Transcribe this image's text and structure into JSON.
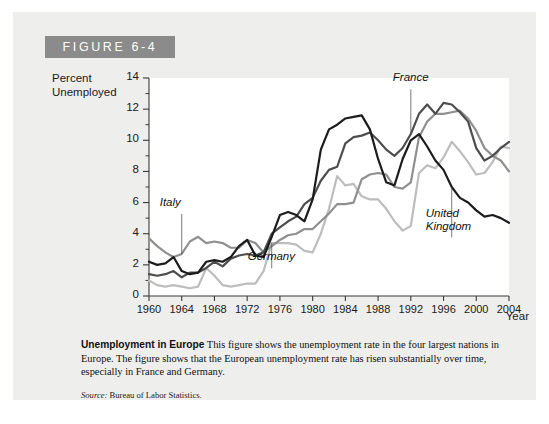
{
  "figure": {
    "tag": "FIGURE 6-4",
    "caption_title": "Unemployment in Europe",
    "caption_body": "This figure shows the unemployment rate in the four largest nations in Europe. The figure shows that the European unemployment rate has risen substantially over time, especially in France and Germany.",
    "source_label": "Source:",
    "source_text": "Bureau of Labor Statistics."
  },
  "colors": {
    "tag_background": "#8b8b8b",
    "panel_background": "#eeeeec",
    "plot_background": "#ffffff",
    "axis": "#3a3a3a",
    "united_kingdom": "#1c1c1c",
    "france": "#4d4d4d",
    "italy": "#8f8f8f",
    "germany": "#bdbdbd"
  },
  "chart_data": {
    "type": "line",
    "title": "Unemployment in Europe",
    "xlabel": "Year",
    "ylabel": "Percent Unemployed",
    "ylabel_lines": "Percent\nUnemployed",
    "xlim": [
      1960,
      2004
    ],
    "ylim": [
      0,
      14
    ],
    "grid": false,
    "legend": "inline-annotations",
    "ytick_labels": [
      "0",
      "2",
      "4",
      "6",
      "8",
      "10",
      "12",
      "14"
    ],
    "ytick_values": [
      0,
      2,
      4,
      6,
      8,
      10,
      12,
      14
    ],
    "yminor_values": [
      1,
      3,
      5,
      7,
      9,
      11,
      13
    ],
    "xtick_labels": [
      "1960",
      "1964",
      "1968",
      "1972",
      "1976",
      "1980",
      "1984",
      "1988",
      "1992",
      "1996",
      "2000",
      "2004"
    ],
    "xtick_values": [
      1960,
      1964,
      1968,
      1972,
      1976,
      1980,
      1984,
      1988,
      1992,
      1996,
      2000,
      2004
    ],
    "x": [
      1960,
      1961,
      1962,
      1963,
      1964,
      1965,
      1966,
      1967,
      1968,
      1969,
      1970,
      1971,
      1972,
      1973,
      1974,
      1975,
      1976,
      1977,
      1978,
      1979,
      1980,
      1981,
      1982,
      1983,
      1984,
      1985,
      1986,
      1987,
      1988,
      1989,
      1990,
      1991,
      1992,
      1993,
      1994,
      1995,
      1996,
      1997,
      1998,
      1999,
      2000,
      2001,
      2002,
      2003,
      2004
    ],
    "series": [
      {
        "name": "United Kingdom",
        "label": "United\nKingdom",
        "color": "#1c1c1c",
        "values": [
          2.2,
          2.0,
          2.1,
          2.5,
          1.6,
          1.4,
          1.5,
          2.2,
          2.3,
          2.2,
          2.5,
          3.2,
          3.6,
          2.6,
          2.5,
          3.8,
          5.2,
          5.4,
          5.2,
          4.8,
          6.2,
          9.4,
          10.7,
          11.0,
          11.4,
          11.5,
          11.6,
          10.7,
          8.8,
          7.3,
          7.1,
          8.8,
          10.0,
          10.4,
          9.6,
          8.7,
          8.1,
          7.0,
          6.3,
          6.0,
          5.5,
          5.1,
          5.2,
          5.0,
          4.7
        ]
      },
      {
        "name": "France",
        "label": "France",
        "color": "#4d4d4d",
        "values": [
          1.4,
          1.3,
          1.4,
          1.6,
          1.2,
          1.5,
          1.5,
          1.8,
          2.2,
          1.9,
          2.4,
          2.6,
          2.7,
          2.6,
          2.8,
          4.0,
          4.4,
          4.8,
          5.1,
          5.9,
          6.3,
          7.4,
          8.1,
          8.3,
          9.8,
          10.2,
          10.3,
          10.5,
          10.0,
          9.4,
          9.0,
          9.5,
          10.4,
          11.7,
          12.3,
          11.7,
          12.4,
          12.3,
          11.8,
          11.2,
          9.5,
          8.7,
          9.0,
          9.5,
          9.9
        ]
      },
      {
        "name": "Italy",
        "label": "Italy",
        "color": "#8f8f8f",
        "values": [
          3.7,
          3.2,
          2.8,
          2.5,
          2.7,
          3.5,
          3.8,
          3.4,
          3.5,
          3.4,
          3.1,
          3.1,
          3.6,
          3.4,
          2.8,
          3.2,
          3.6,
          3.9,
          4.0,
          4.3,
          4.3,
          4.8,
          5.3,
          5.9,
          5.9,
          6.0,
          7.5,
          7.8,
          7.9,
          7.8,
          7.0,
          6.9,
          7.3,
          10.2,
          11.2,
          11.7,
          11.7,
          11.8,
          11.9,
          11.4,
          10.6,
          9.5,
          9.0,
          8.7,
          8.0
        ]
      },
      {
        "name": "Germany",
        "label": "Germany",
        "color": "#bdbdbd",
        "values": [
          1.0,
          0.7,
          0.6,
          0.7,
          0.6,
          0.5,
          0.6,
          1.8,
          1.3,
          0.7,
          0.6,
          0.7,
          0.8,
          0.8,
          1.6,
          3.4,
          3.4,
          3.4,
          3.3,
          2.9,
          2.8,
          4.0,
          5.6,
          7.7,
          7.1,
          7.2,
          6.4,
          6.2,
          6.2,
          5.6,
          4.8,
          4.2,
          4.5,
          7.9,
          8.4,
          8.2,
          8.9,
          9.9,
          9.3,
          8.6,
          7.8,
          7.9,
          8.6,
          9.6,
          9.5
        ]
      }
    ],
    "annotations": [
      {
        "name": "italy",
        "label": "Italy",
        "x": 1964,
        "y": 5.4
      },
      {
        "name": "germany",
        "label": "Germany",
        "x": 1975,
        "y": 1.9
      },
      {
        "name": "france",
        "label": "France",
        "x": 1992,
        "y": 13.4
      },
      {
        "name": "united-kingdom",
        "label": "United\nKingdom",
        "x": 1997,
        "y": 3.9
      }
    ]
  }
}
